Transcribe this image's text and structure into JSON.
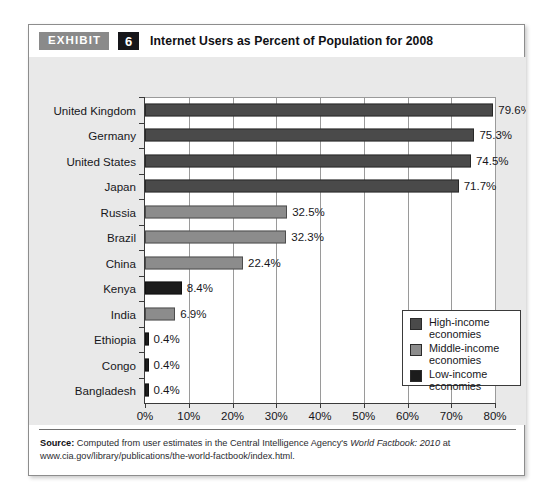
{
  "exhibit": {
    "tag": "EXHIBIT",
    "number": "6",
    "title": "Internet Users as Percent of Population for 2008"
  },
  "chart_data": {
    "type": "bar",
    "orientation": "horizontal",
    "title": "Internet Users as Percent of Population for 2008",
    "xlabel": "Percentage of Internet users",
    "ylabel": "",
    "xlim": [
      0,
      80
    ],
    "xticks": [
      "0%",
      "10%",
      "20%",
      "30%",
      "40%",
      "50%",
      "60%",
      "70%",
      "80%"
    ],
    "xtick_values": [
      0,
      10,
      20,
      30,
      40,
      50,
      60,
      70,
      80
    ],
    "grid": true,
    "legend_position": "inside-right",
    "categories": [
      "United Kingdom",
      "Germany",
      "United States",
      "Japan",
      "Russia",
      "Brazil",
      "China",
      "Kenya",
      "India",
      "Ethiopia",
      "Congo",
      "Bangladesh"
    ],
    "values": [
      79.6,
      75.3,
      74.5,
      71.7,
      32.5,
      32.3,
      22.4,
      8.4,
      6.9,
      0.4,
      0.4,
      0.4
    ],
    "data_labels": [
      "79.6%",
      "75.3%",
      "74.5%",
      "71.7%",
      "32.5%",
      "32.3%",
      "22.4%",
      "8.4%",
      "6.9%",
      "0.4%",
      "0.4%",
      "0.4%"
    ],
    "groups": [
      "high",
      "high",
      "high",
      "high",
      "middle",
      "middle",
      "middle",
      "low",
      "middle",
      "low",
      "low",
      "low"
    ],
    "colors": {
      "high": "#4a4a4a",
      "middle": "#8c8c8c",
      "low": "#1c1c1c"
    },
    "legend": [
      {
        "key": "high",
        "label_line1": "High-income",
        "label_line2": "economies"
      },
      {
        "key": "middle",
        "label_line1": "Middle-income",
        "label_line2": "economies"
      },
      {
        "key": "low",
        "label_line1": "Low-income",
        "label_line2": "economies"
      }
    ]
  },
  "source": {
    "label": "Source:",
    "text_before_italic": " Computed from user estimates in the Central Intelligence Agency's ",
    "italic_text": "World Factbook: 2010",
    "text_after_italic": " at www.cia.gov/library/publications/the-world-factbook/index.html."
  }
}
